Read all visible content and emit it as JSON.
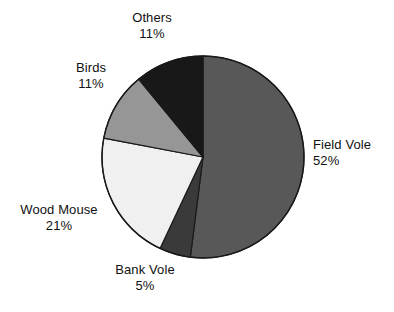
{
  "chart_data": {
    "type": "pie",
    "title": "",
    "subtitle": "",
    "xlabel": "",
    "ylabel": "",
    "legend_position": "none",
    "grid": false,
    "labels_outside": true,
    "start_angle_deg": 0,
    "direction": "clockwise",
    "categories": [
      "Field Vole",
      "Bank Vole",
      "Wood Mouse",
      "Birds",
      "Others"
    ],
    "values": [
      52,
      5,
      21,
      11,
      11
    ],
    "value_unit": "%",
    "slices": [
      {
        "name": "Field Vole",
        "value": 52,
        "value_text": "52%",
        "color": "#585858"
      },
      {
        "name": "Bank Vole",
        "value": 5,
        "value_text": "5%",
        "color": "#3a3a3a"
      },
      {
        "name": "Wood Mouse",
        "value": 21,
        "value_text": "21%",
        "color": "#f0f0f0"
      },
      {
        "name": "Birds",
        "value": 11,
        "value_text": "11%",
        "color": "#969696"
      },
      {
        "name": "Others",
        "value": 11,
        "value_text": "11%",
        "color": "#181818"
      }
    ]
  },
  "labels": {
    "others": {
      "name": "Others",
      "value": "11%"
    },
    "birds": {
      "name": "Birds",
      "value": "11%"
    },
    "field_vole": {
      "name": "Field Vole",
      "value": "52%"
    },
    "wood_mouse": {
      "name": "Wood Mouse",
      "value": "21%"
    },
    "bank_vole": {
      "name": "Bank Vole",
      "value": "5%"
    }
  },
  "style": {
    "background": "#ffffff",
    "outline": "#1a1a1a",
    "text": "#111111"
  }
}
